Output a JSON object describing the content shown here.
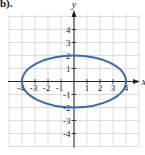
{
  "part_label": "b).",
  "chart_data": {
    "type": "line",
    "title": "",
    "xlabel": "x",
    "ylabel": "y",
    "xlim": [
      -5,
      5
    ],
    "ylim": [
      -5,
      5
    ],
    "grid": true,
    "x_ticks": [
      -4,
      -3,
      -2,
      -1,
      1,
      2,
      3,
      4
    ],
    "y_ticks": [
      -4,
      -3,
      -2,
      -1,
      1,
      2,
      3,
      4
    ],
    "x_tick_labels": [
      "-4",
      "-3",
      "-2",
      "-1",
      "1",
      "2",
      "3",
      "4"
    ],
    "y_tick_labels": [
      "-4",
      "-3",
      "-2",
      "-1",
      "1",
      "2",
      "3",
      "4"
    ],
    "series": [
      {
        "name": "ellipse",
        "equation": "x^2/16 + y^2/4 = 1",
        "center": [
          0,
          0
        ],
        "semi_major_x": 4,
        "semi_minor_y": 2,
        "key_points": [
          [
            -4,
            0
          ],
          [
            4,
            0
          ],
          [
            0,
            2
          ],
          [
            0,
            -2
          ]
        ],
        "color": "#3b6aa8"
      }
    ]
  },
  "colors": {
    "grid": "#d4d4d4",
    "axis": "#222222",
    "curve": "#3b6aa8"
  }
}
